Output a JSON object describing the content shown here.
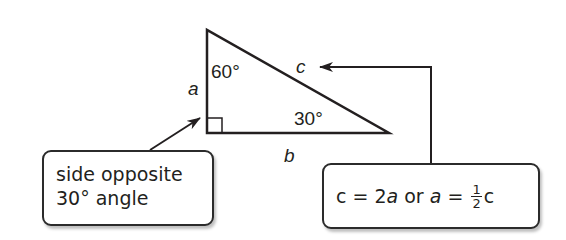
{
  "diagram": {
    "triangle": {
      "vertices": {
        "top": [
          207,
          30
        ],
        "right_angle": [
          207,
          133
        ],
        "right": [
          389,
          133
        ]
      },
      "side_labels": {
        "a": "a",
        "b": "b",
        "c": "c"
      },
      "angle_labels": {
        "top": "60°",
        "right": "30°"
      },
      "right_angle_marker": true
    },
    "callouts": {
      "left": {
        "line1": "side opposite",
        "line2": "30° angle",
        "points_to": "side a"
      },
      "right": {
        "part1": "c",
        "eq1": " = 2",
        "a1": "a",
        "or": " or ",
        "a2": "a",
        "eq2": " = ",
        "frac_num": "1",
        "frac_den": "2",
        "c2": "c",
        "points_to": "side c"
      }
    },
    "colors": {
      "line": "#231f20",
      "background": "#ffffff",
      "box_border": "#2b2b2b"
    }
  }
}
